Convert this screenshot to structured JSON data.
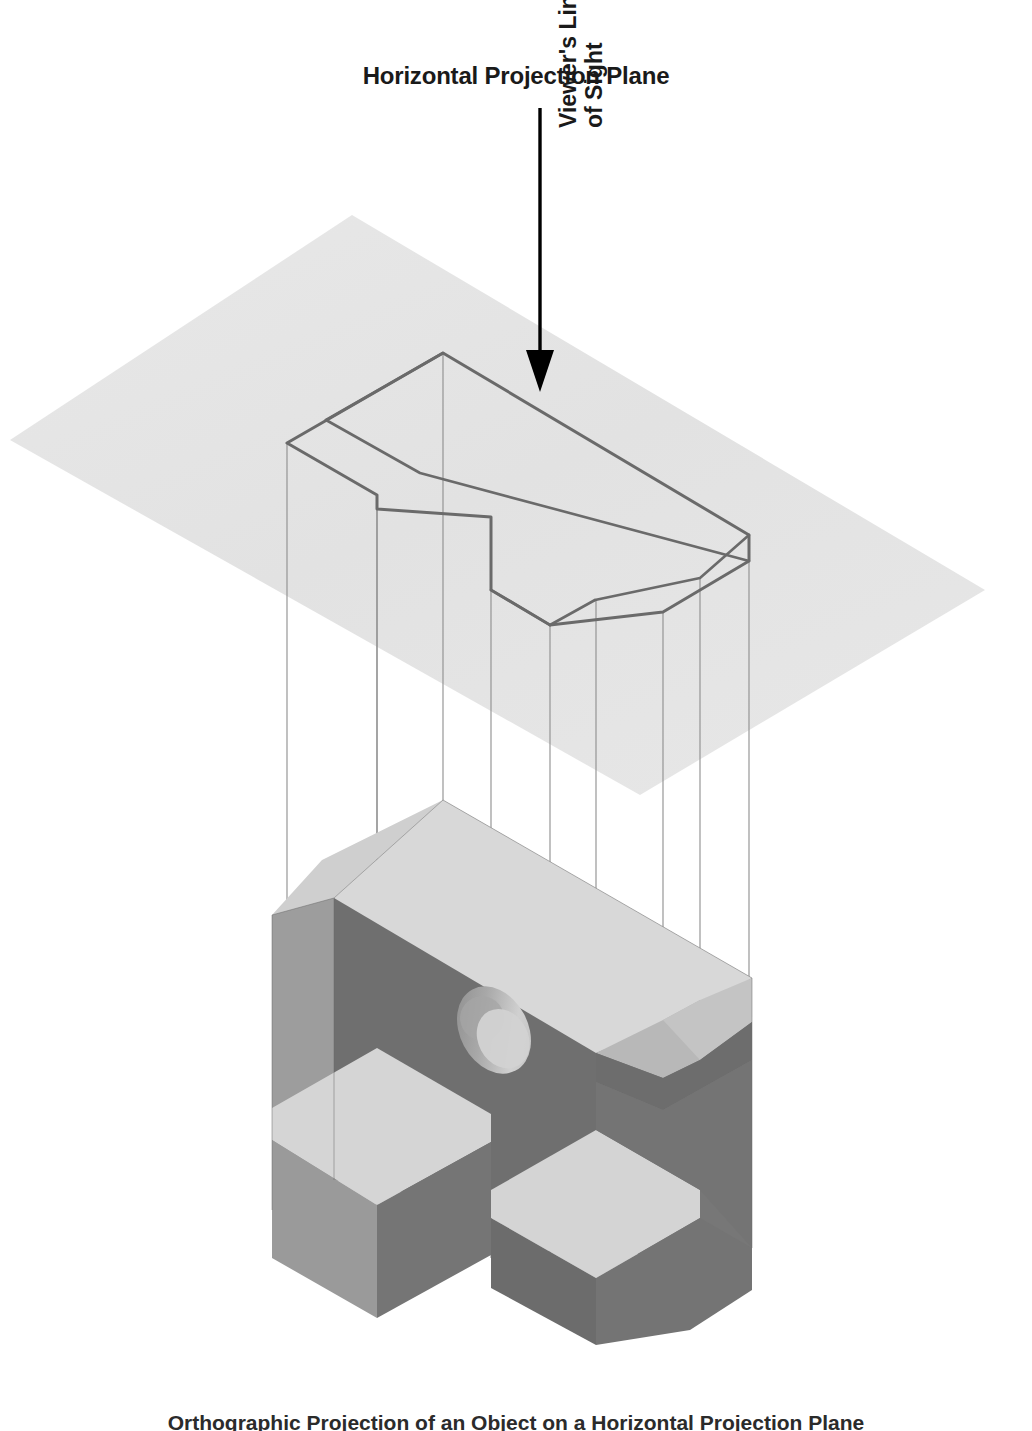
{
  "figure": {
    "title": "Horizontal Projection Plane",
    "sight_label_line1": "Viewer's Line",
    "sight_label_line2": "of Sight",
    "caption": "Orthographic Projection of an Object on a Horizontal Projection Plane",
    "arrow_name": "viewers-line-of-sight-arrow"
  },
  "colors": {
    "background": "#ffffff",
    "plane_fill": "#e3e3e3",
    "plane_fill_light": "#eaeaea",
    "outline_stroke": "#6b6b6b",
    "projector_stroke": "#8a8a8a",
    "top_face": "#d6d6d6",
    "top_face_light": "#dcdcdc",
    "left_face": "#9a9a9a",
    "right_face": "#7a7a7a",
    "chamfer_face": "#b4b4b4",
    "hole_dark": "#8f8f8f",
    "hole_light": "#c9c9c9",
    "text": "#1a1a1a",
    "arrow": "#000000"
  },
  "geometry": {
    "projection_plane_corners": [
      [
        352,
        215
      ],
      [
        985,
        590
      ],
      [
        640,
        795
      ],
      [
        10,
        440
      ]
    ],
    "arrow": {
      "x": 540,
      "y_start": 108,
      "y_end": 390,
      "head_width": 26,
      "head_height": 40
    },
    "top_view_outline": [
      [
        443,
        353
      ],
      [
        749,
        535
      ],
      [
        749,
        561
      ],
      [
        663,
        612
      ],
      [
        550,
        625
      ],
      [
        491,
        590
      ],
      [
        491,
        517
      ],
      [
        377,
        509
      ],
      [
        377,
        495
      ],
      [
        287,
        443
      ]
    ],
    "projector_lines": [
      [
        287,
        443,
        287,
        1130
      ],
      [
        377,
        495,
        377,
        1070
      ],
      [
        377,
        509,
        377,
        1200
      ],
      [
        443,
        353,
        443,
        800
      ],
      [
        491,
        517,
        491,
        1255
      ],
      [
        550,
        625,
        550,
        1300
      ],
      [
        595,
        600,
        595,
        1215
      ],
      [
        663,
        612,
        663,
        1075
      ],
      [
        700,
        577,
        700,
        1020
      ],
      [
        749,
        535,
        749,
        1045
      ]
    ],
    "solid_bounds": {
      "left": 272,
      "right": 752,
      "top": 800,
      "bottom": 1345
    },
    "hole": {
      "cx": 494,
      "cy": 1030,
      "rx": 34,
      "ry": 46,
      "rotation": -28
    }
  }
}
